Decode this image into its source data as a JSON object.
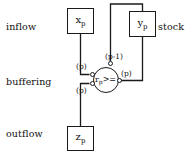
{
  "diagram": {
    "row_labels": [
      {
        "id": "inflow",
        "text": "inflow"
      },
      {
        "id": "buffering",
        "text": "buffering"
      },
      {
        "id": "outflow",
        "text": "outflow"
      }
    ],
    "side_label": {
      "id": "stock",
      "text": "stock"
    },
    "nodes": [
      {
        "id": "xp",
        "base": "x",
        "sub": "p"
      },
      {
        "id": "yp",
        "base": "y",
        "sub": "p"
      },
      {
        "id": "zp",
        "base": "z",
        "sub": "p"
      },
      {
        "id": "rp",
        "base": "r",
        "sub": "p",
        "comparator": ">="
      }
    ],
    "edge_labels": [
      {
        "id": "p-upper-left",
        "text": "(p)"
      },
      {
        "id": "p-lower-left",
        "text": "(p)"
      },
      {
        "id": "p-right",
        "text": "(p)"
      },
      {
        "id": "p-minus-1-top",
        "text": "(p-1)"
      }
    ],
    "colors": {
      "stroke": "#1a1a1a",
      "background": "#ffffff",
      "text": "#111111"
    }
  }
}
